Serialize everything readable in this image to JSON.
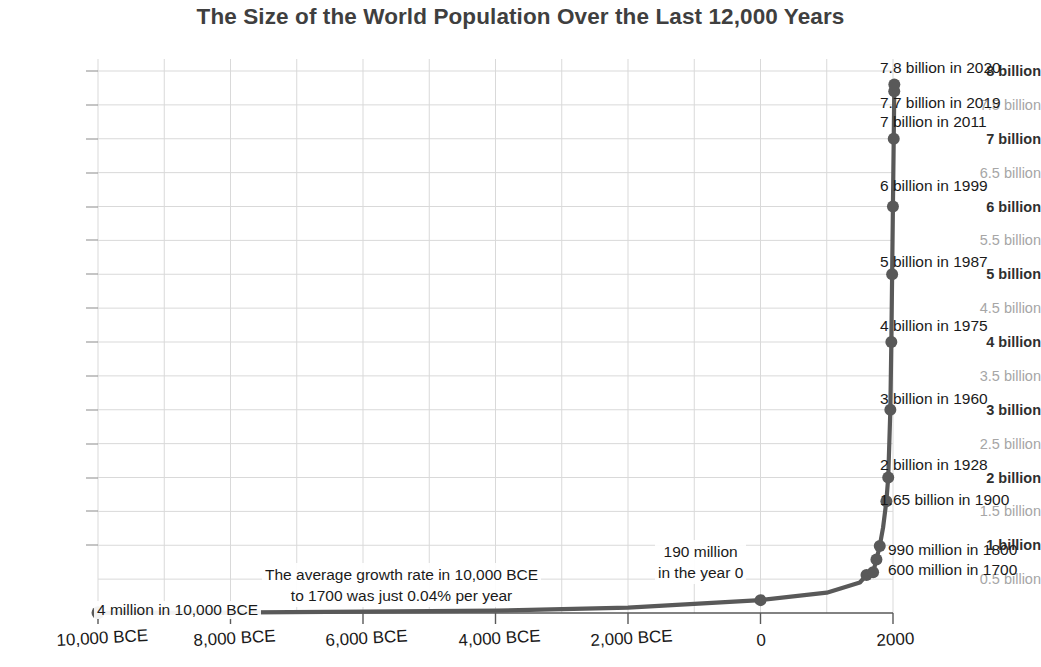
{
  "chart_data": {
    "type": "line",
    "title": "The Size of the World Population Over the Last 12,000 Years",
    "xlabel": "",
    "ylabel": "",
    "grid": true,
    "legend": "none",
    "xlim": [
      -10000,
      2100
    ],
    "ylim": [
      0,
      8200000000
    ],
    "xticks": [
      "10,000 BCE",
      "8,000 BCE",
      "6,000 BCE",
      "4,000 BCE",
      "2,000 BCE",
      "0",
      "2000"
    ],
    "xtick_values": [
      -10000,
      -8000,
      -6000,
      -4000,
      -2000,
      0,
      2000
    ],
    "yticks": [
      {
        "label": "8 billion",
        "value": 8000000000,
        "emphasis": "major"
      },
      {
        "label": "7.5 billion",
        "value": 7500000000,
        "emphasis": "minor"
      },
      {
        "label": "7 billion",
        "value": 7000000000,
        "emphasis": "major"
      },
      {
        "label": "6.5 billion",
        "value": 6500000000,
        "emphasis": "minor"
      },
      {
        "label": "6 billion",
        "value": 6000000000,
        "emphasis": "major"
      },
      {
        "label": "5.5 billion",
        "value": 5500000000,
        "emphasis": "minor"
      },
      {
        "label": "5 billion",
        "value": 5000000000,
        "emphasis": "major"
      },
      {
        "label": "4.5 billion",
        "value": 4500000000,
        "emphasis": "minor"
      },
      {
        "label": "4 billion",
        "value": 4000000000,
        "emphasis": "major"
      },
      {
        "label": "3.5 billion",
        "value": 3500000000,
        "emphasis": "minor"
      },
      {
        "label": "3 billion",
        "value": 3000000000,
        "emphasis": "major"
      },
      {
        "label": "2.5 billion",
        "value": 2500000000,
        "emphasis": "minor"
      },
      {
        "label": "2 billion",
        "value": 2000000000,
        "emphasis": "major"
      },
      {
        "label": "1.5 billion",
        "value": 1500000000,
        "emphasis": "minor"
      },
      {
        "label": "1 billion",
        "value": 1000000000,
        "emphasis": "major"
      },
      {
        "label": "0.5 billion",
        "value": 500000000,
        "emphasis": "minor"
      }
    ],
    "series": [
      {
        "name": "World population",
        "color": "#595959",
        "x": [
          -10000,
          -8000,
          -6000,
          -4000,
          -2000,
          0,
          1000,
          1500,
          1600,
          1700,
          1750,
          1800,
          1850,
          1900,
          1928,
          1960,
          1975,
          1987,
          1999,
          2011,
          2019,
          2020
        ],
        "values": [
          4000000,
          7000000,
          20000000,
          35000000,
          80000000,
          190000000,
          300000000,
          450000000,
          560000000,
          600000000,
          790000000,
          990000000,
          1260000000,
          1650000000,
          2000000000,
          3000000000,
          4000000000,
          5000000000,
          6000000000,
          7000000000,
          7700000000,
          7800000000
        ]
      }
    ],
    "point_labels": [
      {
        "text": "7.8 billion in 2020",
        "year": 2020,
        "value": 7800000000
      },
      {
        "text": "7.7 billion in 2019",
        "year": 2019,
        "value": 7700000000
      },
      {
        "text": "7 billion in 2011",
        "year": 2011,
        "value": 7000000000
      },
      {
        "text": "6 billion in 1999",
        "year": 1999,
        "value": 6000000000
      },
      {
        "text": "5 billion in 1987",
        "year": 1987,
        "value": 5000000000
      },
      {
        "text": "4 billion in 1975",
        "year": 1975,
        "value": 4000000000
      },
      {
        "text": "3 billion in 1960",
        "year": 1960,
        "value": 3000000000
      },
      {
        "text": "2 billion in 1928",
        "year": 1928,
        "value": 2000000000
      },
      {
        "text": "1.65 billion in 1900",
        "year": 1900,
        "value": 1650000000
      },
      {
        "text": "990 million in 1800",
        "year": 1800,
        "value": 990000000
      },
      {
        "text": "600 million in 1700",
        "year": 1700,
        "value": 600000000
      }
    ],
    "annotations": [
      {
        "name": "growth-rate-note",
        "line1": "The average growth rate in 10,000 BCE",
        "line2": "to 1700 was just 0.04% per year"
      },
      {
        "name": "year-zero-note",
        "line1": "190 million",
        "line2": "in the year 0"
      },
      {
        "name": "origin-note",
        "line1": "4 million in 10,000 BCE"
      }
    ]
  },
  "colors": {
    "line": "#595959",
    "marker": "#595959",
    "grid": "#d9d9d9",
    "axis": "#595959",
    "major_tick_text": "#2f2f2f",
    "minor_tick_text": "#a6a6a6",
    "title": "#3f3f3f"
  }
}
